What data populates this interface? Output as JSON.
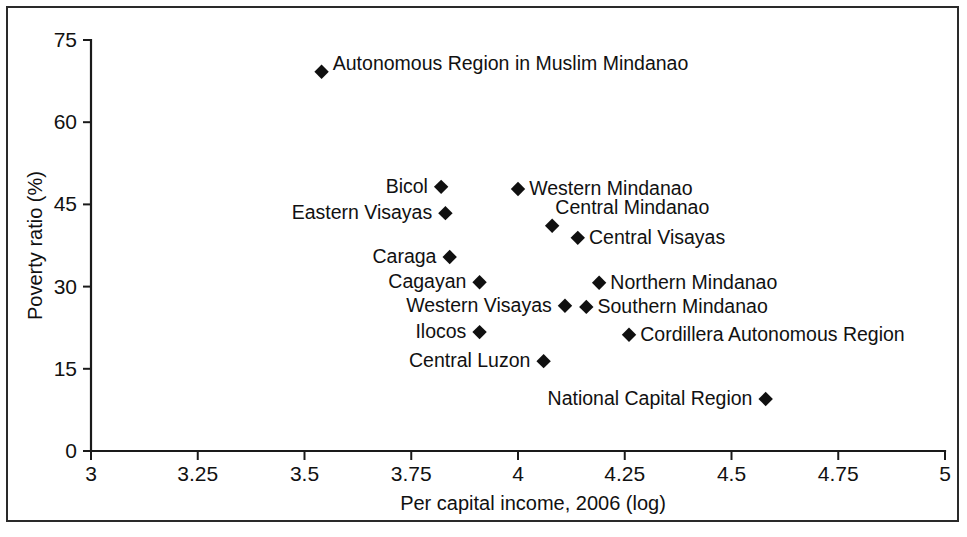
{
  "chart_data": {
    "type": "scatter",
    "title": "",
    "xlabel": "Per capital income, 2006 (log)",
    "ylabel": "Poverty ratio (%)",
    "xlim": [
      3,
      5
    ],
    "ylim": [
      0,
      75
    ],
    "xticks": [
      "3",
      "3.25",
      "3.5",
      "3.75",
      "4",
      "4.25",
      "4.5",
      "4.75",
      "5"
    ],
    "xtick_values": [
      3,
      3.25,
      3.5,
      3.75,
      4,
      4.25,
      4.5,
      4.75,
      5
    ],
    "yticks": [
      "0",
      "15",
      "30",
      "45",
      "60",
      "75"
    ],
    "ytick_values": [
      0,
      15,
      30,
      45,
      60,
      75
    ],
    "grid": false,
    "legend": "none",
    "marker": "filled-diamond",
    "marker_color": "#101010",
    "points": [
      {
        "label": "Autonomous Region in Muslim Mindanao",
        "x": 3.54,
        "y": 69.2,
        "label_side": "right"
      },
      {
        "label": "Bicol",
        "x": 3.82,
        "y": 48.2,
        "label_side": "left"
      },
      {
        "label": "Western Mindanao",
        "x": 4.0,
        "y": 47.8,
        "label_side": "right"
      },
      {
        "label": "Eastern Visayas",
        "x": 3.83,
        "y": 43.4,
        "label_side": "left"
      },
      {
        "label": "Central Mindanao",
        "x": 4.08,
        "y": 41.1,
        "label_side": "right-above"
      },
      {
        "label": "Central Visayas",
        "x": 4.14,
        "y": 38.9,
        "label_side": "right"
      },
      {
        "label": "Caraga",
        "x": 3.84,
        "y": 35.4,
        "label_side": "left"
      },
      {
        "label": "Cagayan",
        "x": 3.91,
        "y": 30.8,
        "label_side": "left"
      },
      {
        "label": "Northern Mindanao",
        "x": 4.19,
        "y": 30.7,
        "label_side": "right"
      },
      {
        "label": "Western Visayas",
        "x": 4.11,
        "y": 26.5,
        "label_side": "left"
      },
      {
        "label": "Southern Mindanao",
        "x": 4.16,
        "y": 26.3,
        "label_side": "right"
      },
      {
        "label": "Ilocos",
        "x": 3.91,
        "y": 21.7,
        "label_side": "left"
      },
      {
        "label": "Cordillera Autonomous Region",
        "x": 4.26,
        "y": 21.2,
        "label_side": "right"
      },
      {
        "label": "Central Luzon",
        "x": 4.06,
        "y": 16.4,
        "label_side": "left"
      },
      {
        "label": "National Capital Region",
        "x": 4.58,
        "y": 9.5,
        "label_side": "left"
      }
    ]
  },
  "figure": {
    "background_color": "#ffffff",
    "frame_color": "#2a2a2a",
    "axis_color": "#1a1a1a"
  }
}
